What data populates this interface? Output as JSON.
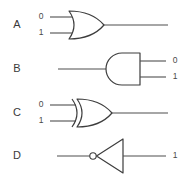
{
  "diagram": {
    "background_color": "#ffffff",
    "line_color": "#4f4f4f",
    "gate_stroke_color": "#3d3d3d",
    "text_color": "#3a3a3a",
    "rows": [
      {
        "id": "a",
        "label": "A",
        "gate_type": "or-gate",
        "orientation": "inputs-left",
        "input_labels": [
          "0",
          "1"
        ],
        "output_labels": []
      },
      {
        "id": "b",
        "label": "B",
        "gate_type": "and-gate",
        "orientation": "mirrored",
        "input_labels": [],
        "output_labels": [
          "0",
          "1"
        ]
      },
      {
        "id": "c",
        "label": "C",
        "gate_type": "xor-gate",
        "orientation": "inputs-left",
        "input_labels": [
          "0",
          "1"
        ],
        "output_labels": []
      },
      {
        "id": "d",
        "label": "D",
        "gate_type": "not-gate",
        "orientation": "mirrored-bubble-left",
        "input_labels": [],
        "output_labels": [
          "1"
        ]
      }
    ]
  }
}
